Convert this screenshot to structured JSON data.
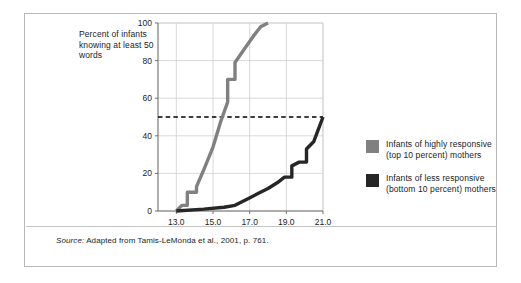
{
  "figure": {
    "title_lines": "Percent of infants knowing at least 50 words",
    "source_prefix": "Source:",
    "source_text": " Adapted from Tamis-LeMonda et al., 2001, p. 761."
  },
  "legend": {
    "items": [
      {
        "label": "Infants of highly responsive (top 10 percent) mothers",
        "color": "#808080"
      },
      {
        "label": "Infants of less responsive (bottom 10 percent) mothers",
        "color": "#262626"
      }
    ]
  },
  "chart_data": {
    "type": "line",
    "title": "Percent of infants knowing at least 50 words",
    "xlabel": "Age in months",
    "ylabel": "Percent of infants knowing at least 50 words",
    "xlim": [
      12.0,
      21.0
    ],
    "ylim": [
      0,
      100
    ],
    "xticks": [
      13.0,
      15.0,
      17.0,
      19.0,
      21.0
    ],
    "xtick_labels": [
      "13.0",
      "15.0",
      "17.0",
      "19.0",
      "21.0"
    ],
    "yticks": [
      0,
      20,
      40,
      60,
      80,
      100
    ],
    "ytick_labels": [
      "0",
      "20",
      "40",
      "60",
      "80",
      "100"
    ],
    "grid": true,
    "legend_position": "right",
    "annotations": [
      {
        "type": "hline",
        "y": 50,
        "style": "dashed",
        "color": "#000000"
      }
    ],
    "series": [
      {
        "name": "Infants of highly responsive (top 10 percent) mothers",
        "color": "#808080",
        "x": [
          13.0,
          13.3,
          13.6,
          13.6,
          14.1,
          14.1,
          14.5,
          15.0,
          15.4,
          15.8,
          15.8,
          16.2,
          16.2,
          16.7,
          17.2,
          17.6,
          18.0
        ],
        "y": [
          0,
          3,
          3,
          10,
          10,
          13,
          22,
          34,
          47,
          58,
          70,
          70,
          79,
          86,
          93,
          98,
          100
        ]
      },
      {
        "name": "Infants of less responsive (bottom 10 percent) mothers",
        "color": "#262626",
        "x": [
          13.0,
          14.5,
          15.6,
          16.2,
          16.8,
          17.4,
          18.0,
          18.5,
          18.9,
          19.3,
          19.3,
          19.7,
          20.1,
          20.1,
          20.5,
          21.0
        ],
        "y": [
          0,
          1,
          2,
          3,
          6,
          9,
          12,
          15,
          18,
          18,
          24,
          26,
          26,
          33,
          37,
          50
        ]
      }
    ]
  }
}
